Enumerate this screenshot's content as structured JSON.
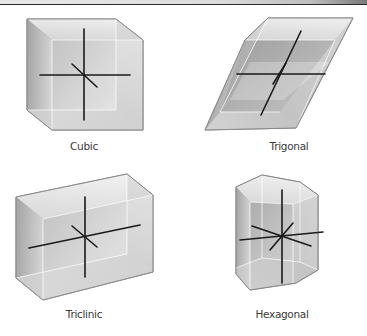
{
  "figure": {
    "type": "crystal-systems-diagram",
    "crystals": [
      {
        "id": "cubic",
        "label": "Cubic"
      },
      {
        "id": "trigonal",
        "label": "Trigonal"
      },
      {
        "id": "triclinic",
        "label": "Triclinic"
      },
      {
        "id": "hexagonal",
        "label": "Hexagonal"
      }
    ]
  },
  "colors": {
    "outline": "#8a8a8a",
    "axis": "#1a1a1a",
    "face_light": "#f2f2f2",
    "face_mid": "#cfcfcf",
    "face_dark": "#9a9a9a",
    "label": "#3a3a3a"
  }
}
